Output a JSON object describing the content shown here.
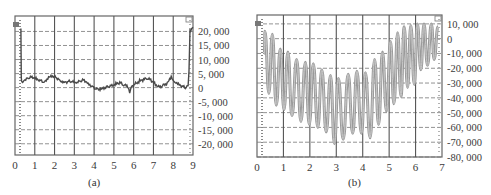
{
  "chart_data": [
    {
      "id": "a",
      "type": "line",
      "caption": "(a)",
      "title": "",
      "xlabel": "",
      "ylabel": "",
      "x_ticks": [
        "0",
        "1",
        "2",
        "3",
        "4",
        "5",
        "6",
        "7",
        "8",
        "9"
      ],
      "y_ticks": [
        "20, 000",
        "15, 000",
        "10, 000",
        "5, 000",
        "0",
        "-5, 000",
        "-10, 000",
        "-15, 000",
        "-20, 000"
      ],
      "y_tick_values": [
        20000,
        15000,
        10000,
        5000,
        0,
        -5000,
        -10000,
        -15000,
        -20000
      ],
      "xlim": [
        0,
        9
      ],
      "ylim": [
        -24000,
        25500
      ],
      "y_axis_position": "right",
      "grid": {
        "vertical": "solid",
        "horizontal": "dashed"
      },
      "series": [
        {
          "name": "signal",
          "color": "#4a4a4a",
          "x": [
            0.3,
            0.32,
            0.35,
            0.5,
            0.7,
            0.9,
            1.1,
            1.3,
            1.5,
            1.7,
            1.9,
            2.1,
            2.3,
            2.5,
            2.7,
            2.9,
            3.1,
            3.3,
            3.5,
            3.7,
            3.9,
            4.1,
            4.3,
            4.5,
            4.7,
            4.9,
            5.1,
            5.3,
            5.5,
            5.7,
            5.8,
            5.9,
            6.1,
            6.3,
            6.5,
            6.7,
            6.9,
            7.1,
            7.3,
            7.5,
            7.7,
            7.9,
            8.0,
            8.1,
            8.3,
            8.5,
            8.65,
            8.75,
            8.8,
            8.85,
            9.0
          ],
          "y": [
            21000,
            3000,
            1500,
            2500,
            3500,
            3800,
            3200,
            2500,
            1800,
            3500,
            4000,
            3600,
            2500,
            2000,
            2200,
            2000,
            1500,
            2300,
            2800,
            1500,
            500,
            -500,
            -800,
            -300,
            400,
            800,
            1400,
            1800,
            800,
            500,
            -1500,
            600,
            1500,
            2300,
            2800,
            3200,
            2600,
            1200,
            300,
            800,
            1400,
            3800,
            2800,
            2200,
            1200,
            400,
            -200,
            500,
            6000,
            20500,
            21500
          ]
        }
      ],
      "markers": [
        "left-edge-marker",
        "right-edge-marker"
      ]
    },
    {
      "id": "b",
      "type": "line",
      "caption": "(b)",
      "title": "",
      "xlabel": "",
      "ylabel": "",
      "x_ticks": [
        "0",
        "1",
        "2",
        "3",
        "4",
        "5",
        "6",
        "7"
      ],
      "y_ticks": [
        "10, 000",
        "0",
        "-10, 000",
        "-20, 000",
        "-30, 000",
        "-40, 000",
        "-50, 000",
        "-60, 000",
        "-70, 000",
        "-80, 000"
      ],
      "y_tick_values": [
        10000,
        0,
        -10000,
        -20000,
        -30000,
        -40000,
        -50000,
        -60000,
        -70000,
        -80000
      ],
      "xlim": [
        0,
        7
      ],
      "ylim": [
        -80000,
        16000
      ],
      "y_axis_position": "right",
      "grid": {
        "vertical": "solid",
        "horizontal": "dashed"
      },
      "series": [
        {
          "name": "oscillation",
          "color": "#5a5a5a",
          "peaks_x": [
            0.3,
            0.58,
            0.88,
            1.17,
            1.5,
            1.83,
            2.13,
            2.45,
            2.78,
            3.08,
            3.45,
            3.78,
            4.1,
            4.45,
            4.75,
            5.05,
            5.32,
            5.57,
            5.82,
            6.07,
            6.32,
            6.6
          ],
          "peaks_y": [
            5000,
            3000,
            -7000,
            -9000,
            -14000,
            -16000,
            -17000,
            -21000,
            -25000,
            -27000,
            -24000,
            -22000,
            -23000,
            -14000,
            -9000,
            -2000,
            4000,
            8000,
            9000,
            10000,
            10000,
            10000
          ],
          "troughs_x": [
            0.45,
            0.73,
            1.02,
            1.32,
            1.66,
            1.98,
            2.3,
            2.62,
            2.93,
            3.26,
            3.62,
            3.95,
            4.28,
            4.6,
            4.9,
            5.18,
            5.45,
            5.7,
            5.95,
            6.2,
            6.45,
            6.7
          ],
          "troughs_y": [
            -37000,
            -45000,
            -48000,
            -52000,
            -56000,
            -58000,
            -60000,
            -63000,
            -71000,
            -68000,
            -64000,
            -64000,
            -67000,
            -58000,
            -49000,
            -44000,
            -39000,
            -33000,
            -31000,
            -21000,
            -18000,
            -14000
          ]
        }
      ],
      "markers": [
        "left-edge-marker",
        "right-edge-marker"
      ]
    }
  ]
}
